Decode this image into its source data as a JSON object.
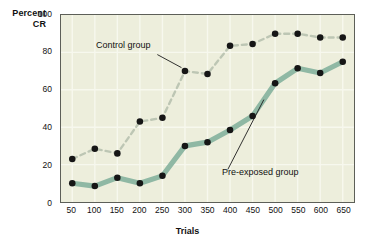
{
  "chart_data": {
    "type": "line",
    "title": "",
    "xlabel": "Trials",
    "ylabel": "Percent CR",
    "ylabel_lines": [
      "Percent",
      "CR"
    ],
    "x": [
      50,
      100,
      150,
      200,
      250,
      300,
      350,
      400,
      450,
      500,
      550,
      600,
      650
    ],
    "categories": [
      "50",
      "100",
      "150",
      "200",
      "250",
      "300",
      "350",
      "400",
      "450",
      "500",
      "550",
      "600",
      "650"
    ],
    "xlim": [
      25,
      675
    ],
    "ylim": [
      0,
      100
    ],
    "yticks": [
      0,
      20,
      40,
      60,
      80,
      100
    ],
    "ytick_labels": [
      "0",
      "20",
      "40",
      "60",
      "80",
      "100"
    ],
    "xtick_labels": [
      "50",
      "100",
      "150",
      "200",
      "250",
      "300",
      "350",
      "400",
      "450",
      "500",
      "550",
      "600",
      "650"
    ],
    "grid": true,
    "legend_position": "inline-annotations",
    "plot_background": "#edeedc",
    "gridline_color": "#f7f8ee",
    "axis_color": "#5d5f58",
    "marker_color": "#161616",
    "series": [
      {
        "name": "Control group",
        "values": [
          23,
          28.5,
          26,
          43,
          45,
          70,
          68.5,
          83.5,
          84.5,
          90,
          90,
          88,
          88
        ],
        "style": "dashed",
        "color": "#bdc6b4",
        "marker": "filled-circle"
      },
      {
        "name": "Pre-exposed group",
        "values": [
          10,
          8.5,
          13,
          10,
          14,
          30,
          32,
          38.5,
          46,
          63.5,
          71.5,
          69,
          75
        ],
        "style": "solid",
        "color": "#8fb8a4",
        "marker": "filled-circle"
      }
    ],
    "annotations": [
      {
        "text": "Control group",
        "points_to_series": "Control group",
        "points_to_x": 300
      },
      {
        "text": "Pre-exposed group",
        "points_to_series": "Pre-exposed group",
        "points_to_x": 475
      }
    ]
  }
}
